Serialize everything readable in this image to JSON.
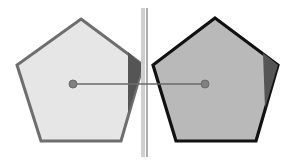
{
  "diagram": {
    "colors": {
      "background": "#ffffff",
      "left_fill": "#e6e6e6",
      "left_stroke": "#6e6e6e",
      "right_fill": "#b9b9b9",
      "right_stroke": "#111111",
      "wedge": "#555555",
      "mirror_band": "#cfcfcf",
      "mirror_line": "#777777",
      "connector": "#6a6a6a",
      "dot": "#808080"
    },
    "left_pentagon": {
      "points": "81,19 143,65 121,141 41,141 17,65",
      "wedge": "128,52 143,65 128,113",
      "center": [
        73,
        84
      ]
    },
    "right_pentagon": {
      "points": "215,18 278,65 256,141 176,141 153,65",
      "wedge": "263,53 278,65 265,108",
      "center": [
        205,
        84
      ]
    },
    "mirror": {
      "x_band": 143,
      "x_line": 147,
      "y1": 8,
      "y2": 157
    },
    "connector": {
      "x1": 73,
      "y1": 84,
      "x2": 205,
      "y2": 84
    }
  }
}
